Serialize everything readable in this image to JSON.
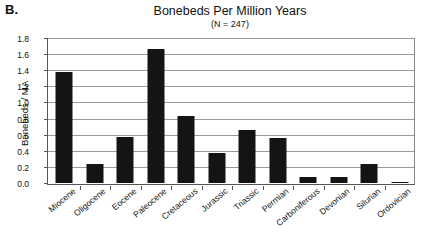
{
  "panel": {
    "label": "B."
  },
  "chart_data": {
    "type": "bar",
    "title": "Bonebeds Per Million Years",
    "subtitle": "(N = 247)",
    "xlabel": "",
    "ylabel": "Bonebeds / MA",
    "ylim": [
      0.0,
      1.8
    ],
    "ytick_step": 0.2,
    "grid": true,
    "legend": false,
    "sample_size_note": "(N = 247)",
    "bar_color": "#141414",
    "categories": [
      "Miocene",
      "Oligocene",
      "Eocene",
      "Paleocene",
      "Cretaceous",
      "Jurassic",
      "Triassic",
      "Permian",
      "Carboniferous",
      "Devonian",
      "Silurian",
      "Ordovician"
    ],
    "values": [
      1.38,
      0.24,
      0.57,
      1.66,
      0.83,
      0.37,
      0.66,
      0.56,
      0.08,
      0.07,
      0.23,
      0.01
    ],
    "ytick_labels": [
      "0.0",
      "0.2",
      "0.4",
      "0.6",
      "0.8",
      "1.0",
      "1.2",
      "1.4",
      "1.6",
      "1.8"
    ],
    "ytick_values": [
      0.0,
      0.2,
      0.4,
      0.6,
      0.8,
      1.0,
      1.2,
      1.4,
      1.6,
      1.8
    ]
  }
}
